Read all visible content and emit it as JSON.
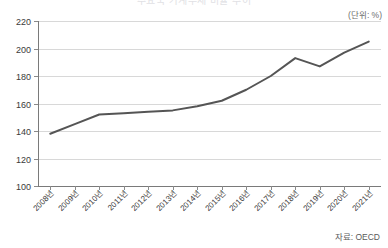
{
  "header": {
    "clipped_title": "주요국 가계부채 비율 추이",
    "unit_label": "(단위: %)"
  },
  "footer": {
    "source_label": "자료: OECD"
  },
  "style": {
    "line_color": "#555555",
    "grid_color": "#d8d8d8",
    "axis_color": "#7a7a7a",
    "background": "#ffffff"
  },
  "chart_data": {
    "type": "line",
    "title": "주요국 가계부채 비율 추이",
    "xlabel": "",
    "ylabel": "",
    "unit": "%",
    "source": "자료: OECD",
    "grid": true,
    "legend": "none",
    "ylim": [
      100,
      220
    ],
    "yticks": [
      100,
      120,
      140,
      160,
      180,
      200,
      220
    ],
    "ytick_labels": [
      "100",
      "120",
      "140",
      "160",
      "180",
      "200",
      "220"
    ],
    "categories": [
      "2008년",
      "2009년",
      "2010년",
      "2011년",
      "2012년",
      "2013년",
      "2014년",
      "2015년",
      "2016년",
      "2017년",
      "2018년",
      "2019년",
      "2020년",
      "2021년"
    ],
    "series": [
      {
        "name": "가계부채 비율",
        "values": [
          138,
          145,
          152,
          153,
          154,
          155,
          158,
          162,
          170,
          180,
          193,
          187,
          197,
          205
        ]
      }
    ]
  }
}
